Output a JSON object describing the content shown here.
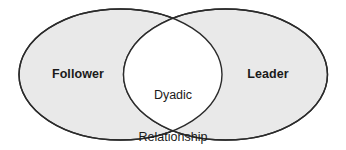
{
  "diagram": {
    "type": "venn-two-set",
    "title": "",
    "background_color": "#ffffff",
    "sets": [
      {
        "id": "follower",
        "label": "Follower",
        "position": "left",
        "fill_color": "#e9e9e9",
        "stroke_color": "#2b2b2b"
      },
      {
        "id": "leader",
        "label": "Leader",
        "position": "right",
        "fill_color": "#e9e9e9",
        "stroke_color": "#2b2b2b"
      }
    ],
    "intersection": {
      "id": "dyadic-relationship",
      "label_line_1": "Dyadic",
      "label_line_2": "Relationship",
      "fill_color": "#ffffff",
      "stroke_color": "#2b2b2b"
    }
  }
}
